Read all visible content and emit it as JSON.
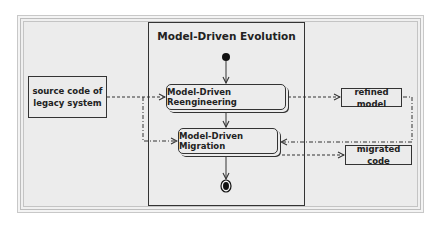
{
  "diagram": {
    "title": "Model-Driven Evolution",
    "inputs": [
      {
        "id": "legacy",
        "label_line1": "source code of",
        "label_line2": "legacy system"
      }
    ],
    "activities": [
      {
        "id": "reengineering",
        "label": "Model-Driven Reengineering"
      },
      {
        "id": "migration",
        "label": "Model-Driven Migration"
      }
    ],
    "outputs": [
      {
        "id": "refined",
        "label": "refined model"
      },
      {
        "id": "migrated",
        "label": "migrated code"
      }
    ],
    "nodes": {
      "initial": "initial-node",
      "final": "final-node"
    },
    "edges": [
      {
        "from": "initial",
        "to": "reengineering",
        "style": "solid"
      },
      {
        "from": "reengineering",
        "to": "migration",
        "style": "solid"
      },
      {
        "from": "migration",
        "to": "final",
        "style": "solid"
      },
      {
        "from": "legacy",
        "to": "reengineering",
        "style": "dashed"
      },
      {
        "from": "legacy",
        "to": "migration",
        "style": "dash-dot"
      },
      {
        "from": "reengineering",
        "to": "refined",
        "style": "dashed"
      },
      {
        "from": "refined",
        "to": "migration",
        "style": "dash-dot"
      },
      {
        "from": "migration",
        "to": "migrated",
        "style": "dashed"
      }
    ]
  }
}
